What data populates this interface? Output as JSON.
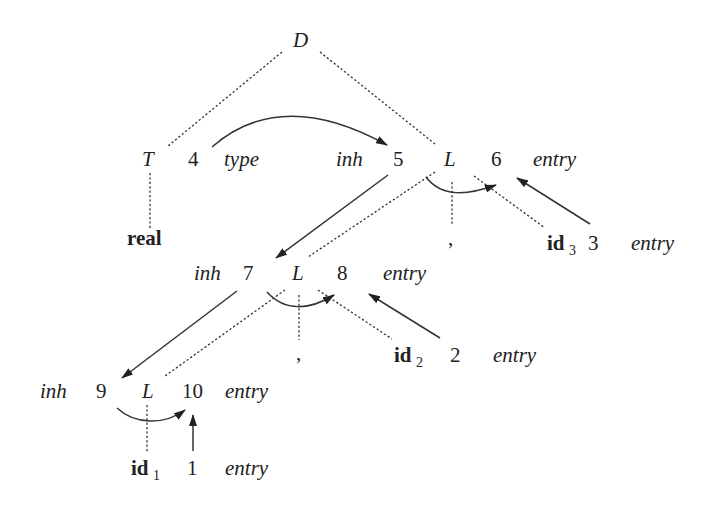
{
  "diagram": {
    "nodes": {
      "D": {
        "label": "D"
      },
      "T": {
        "label": "T",
        "attr_num": "4",
        "attr_name": "type"
      },
      "real": {
        "label": "real"
      },
      "L1": {
        "label": "L",
        "inh_name": "inh",
        "inh_num": "5",
        "syn_num": "6",
        "syn_name": "entry"
      },
      "comma1": {
        "label": ","
      },
      "id3": {
        "label": "id",
        "sub": "3",
        "num": "3",
        "attr": "entry"
      },
      "L2": {
        "label": "L",
        "inh_name": "inh",
        "inh_num": "7",
        "syn_num": "8",
        "syn_name": "entry"
      },
      "comma2": {
        "label": ","
      },
      "id2": {
        "label": "id",
        "sub": "2",
        "num": "2",
        "attr": "entry"
      },
      "L3": {
        "label": "L",
        "inh_name": "inh",
        "inh_num": "9",
        "syn_num": "10",
        "syn_name": "entry"
      },
      "id1": {
        "label": "id",
        "sub": "1",
        "num": "1",
        "attr": "entry"
      }
    },
    "edges": [
      {
        "from": "4",
        "to": "5",
        "kind": "dependency"
      },
      {
        "from": "5",
        "to": "6",
        "kind": "dependency"
      },
      {
        "from": "3",
        "to": "6",
        "kind": "dependency"
      },
      {
        "from": "5",
        "to": "7",
        "kind": "dependency"
      },
      {
        "from": "7",
        "to": "8",
        "kind": "dependency"
      },
      {
        "from": "2",
        "to": "8",
        "kind": "dependency"
      },
      {
        "from": "7",
        "to": "9",
        "kind": "dependency"
      },
      {
        "from": "9",
        "to": "10",
        "kind": "dependency"
      },
      {
        "from": "1",
        "to": "10",
        "kind": "dependency"
      }
    ]
  }
}
